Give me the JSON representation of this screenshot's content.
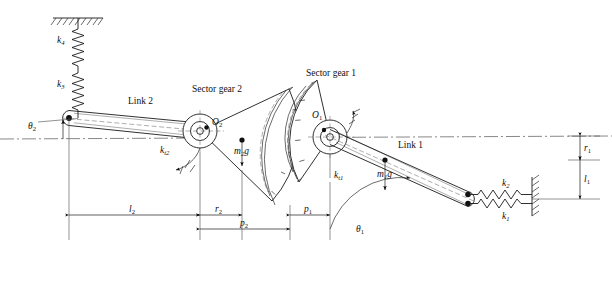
{
  "figure": {
    "type": "mechanical-schematic",
    "background_color": "#ffffff",
    "line_color": "#1a1a1a",
    "title": ""
  },
  "labels": {
    "link2": "Link 2",
    "link1": "Link 1",
    "sector_gear_2": "Sector gear 2",
    "sector_gear_1": "Sector gear 1",
    "pivot_o2": "O",
    "pivot_o2_sub": "2",
    "pivot_o1": "O",
    "pivot_o1_sub": "1",
    "spring_k4": "k",
    "spring_k4_sub": "4",
    "spring_k3": "k",
    "spring_k3_sub": "3",
    "spring_k2": "k",
    "spring_k2_sub": "2",
    "spring_k1": "k",
    "spring_k1_sub": "1",
    "torsion_kt2": "k",
    "torsion_kt2_sub": "t2",
    "torsion_kt1": "k",
    "torsion_kt1_sub": "t1",
    "weight_m2g": "m",
    "weight_m2g_sub": "2",
    "weight_m2g_tail": "g",
    "weight_m1g": "m",
    "weight_m1g_sub": "1",
    "weight_m1g_tail": "g",
    "angle_theta2": "θ",
    "angle_theta2_sub": "2",
    "angle_theta1": "θ",
    "angle_theta1_sub": "1"
  },
  "dimensions": {
    "l2": "l",
    "l2_sub": "2",
    "r2": "r",
    "r2_sub": "2",
    "p2": "p",
    "p2_sub": "2",
    "p1": "p",
    "p1_sub": "1",
    "r1": "r",
    "r1_sub": "1",
    "l1": "l",
    "l1_sub": "1"
  },
  "geometry": {
    "centerline_y": 138,
    "pivot_left": [
      69,
      118
    ],
    "pivot_o2": [
      200,
      131
    ],
    "pivot_o1": [
      330,
      137
    ],
    "link1_right_end": [
      468,
      199
    ],
    "wall_right_x": 532,
    "ground_top": [
      78,
      18
    ]
  }
}
